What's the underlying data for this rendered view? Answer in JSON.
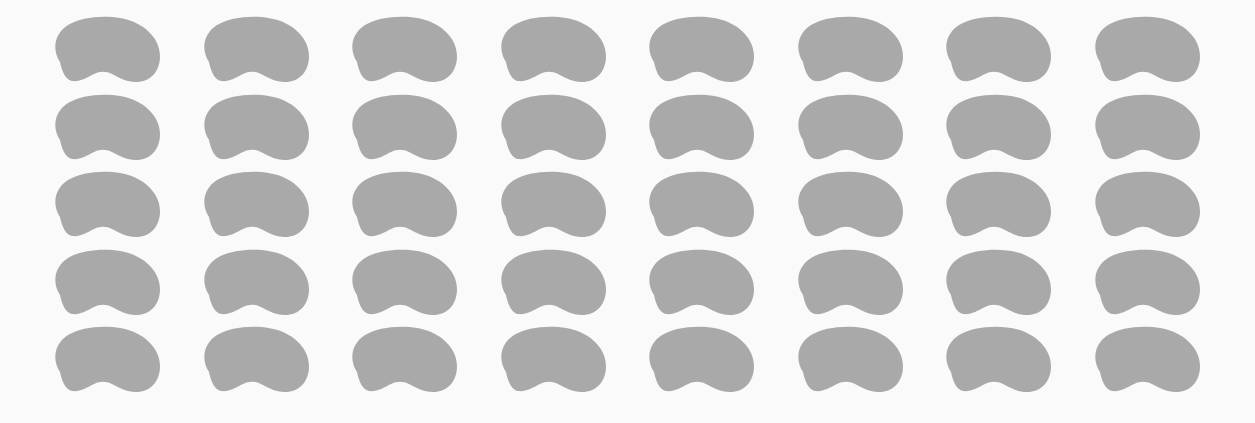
{
  "figure": {
    "rows": 5,
    "columns": 8,
    "total_items": 40,
    "item_shape": "bean",
    "colors": {
      "background": "#fafafa",
      "item_fill": "#a9a9a9"
    }
  }
}
